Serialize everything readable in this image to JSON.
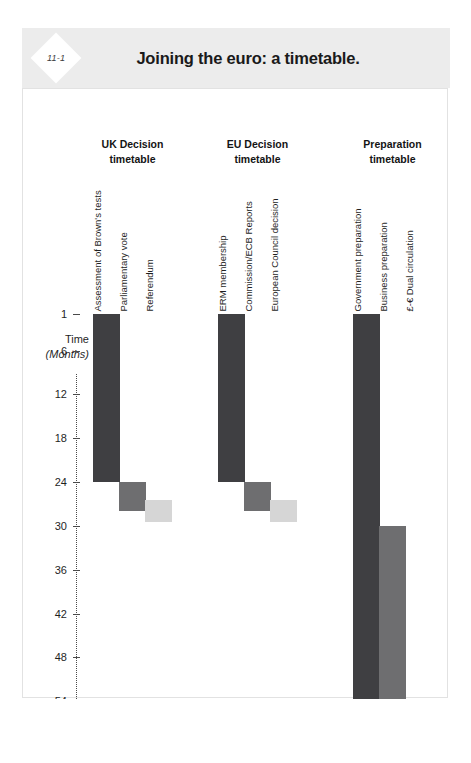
{
  "figure": {
    "badge": "11-1",
    "title": "Joining the euro: a timetable."
  },
  "axis": {
    "title_line1": "Time",
    "title_line2": "(Months)"
  },
  "groups": [
    {
      "header_line1": "UK Decision",
      "header_line2": "timetable",
      "bars": [
        {
          "label": "Assessment of Brown's tests",
          "start": 1,
          "end": 24,
          "color": "#3f3f42"
        },
        {
          "label": "Parliamentary vote",
          "start": 24,
          "end": 28,
          "color": "#6e6e70"
        },
        {
          "label": "Referendum",
          "start": 26.5,
          "end": 29.5,
          "color": "#d6d6d6"
        }
      ]
    },
    {
      "header_line1": "EU Decision",
      "header_line2": "timetable",
      "bars": [
        {
          "label": "ERM membership",
          "start": 1,
          "end": 24,
          "color": "#3f3f42"
        },
        {
          "label": "Commission/ECB Reports",
          "start": 24,
          "end": 28,
          "color": "#6e6e70"
        },
        {
          "label": "European Council decision",
          "start": 26.5,
          "end": 29.5,
          "color": "#d6d6d6"
        }
      ]
    },
    {
      "header_line1": "Preparation",
      "header_line2": "timetable",
      "bars": [
        {
          "label": "Government preparation",
          "start": 1,
          "end": 54,
          "color": "#3f3f42"
        },
        {
          "label": "Business preparation",
          "start": 30,
          "end": 54,
          "color": "#6e6e70"
        },
        {
          "label": "£-€ Dual circulation",
          "start": 54,
          "end": 56.5,
          "color": "#d6d6d6"
        }
      ]
    }
  ],
  "chart_data": {
    "type": "bar",
    "title": "Joining the euro: a timetable.",
    "subtitle": "11-1",
    "orientation": "vertical-gantt",
    "xlabel": "",
    "ylabel": "Time (Months)",
    "ylim": [
      1,
      60
    ],
    "y_inverted": true,
    "yticks": [
      1,
      6,
      12,
      18,
      24,
      30,
      36,
      42,
      48,
      54,
      60
    ],
    "grid": false,
    "legend": "none",
    "groups": [
      "UK Decision timetable",
      "EU Decision timetable",
      "Preparation timetable"
    ],
    "categories": [
      "Assessment of Brown's tests",
      "Parliamentary vote",
      "Referendum",
      "ERM membership",
      "Commission/ECB Reports",
      "European Council decision",
      "Government preparation",
      "Business preparation",
      "£-€ Dual circulation"
    ],
    "series": [
      {
        "name": "start (month)",
        "values": [
          1,
          24,
          26.5,
          1,
          24,
          26.5,
          1,
          30,
          54
        ]
      },
      {
        "name": "end (month)",
        "values": [
          24,
          28,
          29.5,
          24,
          28,
          29.5,
          54,
          54,
          56.5
        ]
      },
      {
        "name": "duration (months)",
        "values": [
          23,
          4,
          3,
          23,
          4,
          3,
          53,
          24,
          2.5
        ]
      }
    ],
    "colors": {
      "dark": "#3f3f42",
      "mid": "#6e6e70",
      "light": "#d6d6d6",
      "header_band": "#ececec",
      "card_border": "#e2e2e2"
    }
  }
}
